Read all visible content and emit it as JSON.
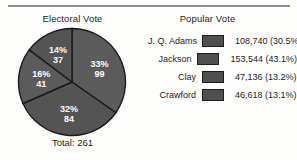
{
  "figure": {
    "electoral": {
      "title": "Electoral Vote",
      "total_label": "Total: 261"
    },
    "popular": {
      "title": "Popular Vote"
    }
  },
  "legend": {
    "rows": [
      {
        "name": "J. Q. Adams",
        "value": "108,740 (30.5%)",
        "swatch": "legend-swatch-adams"
      },
      {
        "name": "Jackson",
        "value": "153,544 (43.1%)",
        "swatch": "legend-swatch-jackson"
      },
      {
        "name": "Clay",
        "value": "47,136 (13.2%)",
        "swatch": "legend-swatch-clay"
      },
      {
        "name": "Crawford",
        "value": "46,618 (13.1%)",
        "swatch": "legend-swatch-crawford"
      }
    ]
  },
  "colors": {
    "slice_fill": "#5b5b5b",
    "slice_fill_alt": "#545454",
    "slice_edge": "#1a1a1a",
    "swatch_fill": "#4f4f4f",
    "swatch_edge": "#1d1d1d",
    "label_text": "#ffffff",
    "rule": "#8d8d8d",
    "background": "#fdfdfc"
  },
  "chart_data": {
    "type": "pie",
    "title": "Electoral Vote",
    "total": 261,
    "total_label": "Total: 261",
    "start_angle_deg": 0,
    "direction": "clockwise",
    "labels": [
      "J. Q. Adams",
      "Jackson",
      "Clay",
      "Crawford"
    ],
    "slice_order": [
      "Jackson",
      "Adams",
      "Crawford",
      "Clay"
    ],
    "slices": [
      {
        "name": "Jackson",
        "percent": 33,
        "value": 99,
        "percent_label": "33%",
        "value_label": "99"
      },
      {
        "name": "Adams",
        "percent": 32,
        "value": 84,
        "percent_label": "32%",
        "value_label": "84"
      },
      {
        "name": "Crawford",
        "percent": 16,
        "value": 41,
        "percent_label": "16%",
        "value_label": "41"
      },
      {
        "name": "Clay",
        "percent": 14,
        "value": 37,
        "percent_label": "14%",
        "value_label": "37"
      }
    ],
    "legend_position": "right",
    "grid": false,
    "secondary_table": {
      "type": "table",
      "title": "Popular Vote",
      "columns": [
        "Candidate",
        "Votes (Share)"
      ],
      "rows": [
        [
          "J. Q. Adams",
          "108,740 (30.5%)"
        ],
        [
          "Jackson",
          "153,544 (43.1%)"
        ],
        [
          "Clay",
          "47,136 (13.2%)"
        ],
        [
          "Crawford",
          "46,618 (13.1%)"
        ]
      ],
      "values": [
        108740,
        153544,
        47136,
        46618
      ],
      "percents": [
        30.5,
        43.1,
        13.2,
        13.1
      ]
    }
  }
}
